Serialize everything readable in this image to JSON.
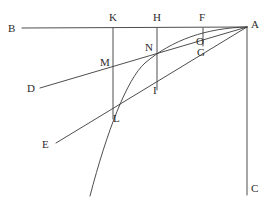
{
  "figure": {
    "type": "geometry-diagram",
    "title": "",
    "stroke_color": "#3a3a3a",
    "label_color": "#2b2b2b",
    "background_color": "#ffffff",
    "width": 274,
    "height": 205
  },
  "points": [
    {
      "name": "B",
      "label": "B",
      "x": 22,
      "y": 28,
      "label_x": 8,
      "label_y": 23
    },
    {
      "name": "K",
      "label": "K",
      "x": 113,
      "y": 28,
      "label_x": 109,
      "label_y": 12
    },
    {
      "name": "H",
      "label": "H",
      "x": 157,
      "y": 28,
      "label_x": 153,
      "label_y": 12
    },
    {
      "name": "F",
      "label": "F",
      "x": 203,
      "y": 28,
      "label_x": 199,
      "label_y": 12
    },
    {
      "name": "A",
      "label": "A",
      "x": 247,
      "y": 27,
      "label_x": 251,
      "label_y": 19
    },
    {
      "name": "C",
      "label": "C",
      "x": 247,
      "y": 195,
      "label_x": 251,
      "label_y": 183
    },
    {
      "name": "D",
      "label": "D",
      "x": 40,
      "y": 88,
      "label_x": 27,
      "label_y": 83
    },
    {
      "name": "E",
      "label": "E",
      "x": 56,
      "y": 143,
      "label_x": 42,
      "label_y": 139
    },
    {
      "name": "M",
      "label": "M",
      "x": 113,
      "y": 68,
      "label_x": 100,
      "label_y": 57
    },
    {
      "name": "N",
      "label": "N",
      "x": 157,
      "y": 55,
      "label_x": 145,
      "label_y": 42
    },
    {
      "name": "O",
      "label": "O",
      "x": 203,
      "y": 45,
      "label_x": 196,
      "label_y": 36
    },
    {
      "name": "G",
      "label": "G",
      "x": 203,
      "y": 52,
      "label_x": 197,
      "label_y": 47
    },
    {
      "name": "I",
      "label": "I",
      "x": 157,
      "y": 90,
      "label_x": 153,
      "label_y": 85
    },
    {
      "name": "L",
      "label": "L",
      "x": 113,
      "y": 112,
      "label_x": 113,
      "label_y": 113
    }
  ],
  "segments": [
    {
      "name": "line-BA",
      "d": "M 22 28 L 247 27"
    },
    {
      "name": "line-AC",
      "d": "M 247 27 L 247 195"
    },
    {
      "name": "line-DA",
      "d": "M 40 88 L 247 27"
    },
    {
      "name": "line-EA",
      "d": "M 56 143 L 247 27"
    },
    {
      "name": "line-K-vertical",
      "d": "M 113 28 L 113 119"
    },
    {
      "name": "line-H-vertical",
      "d": "M 157 28 L 157 90"
    },
    {
      "name": "line-F-vertical",
      "d": "M 203 28 L 203 46"
    }
  ],
  "curves": [
    {
      "name": "curve-A-N-L",
      "d": "M 247 27 C 206 28 172 40 145 63 C 127 79 107 131 90 196"
    }
  ]
}
